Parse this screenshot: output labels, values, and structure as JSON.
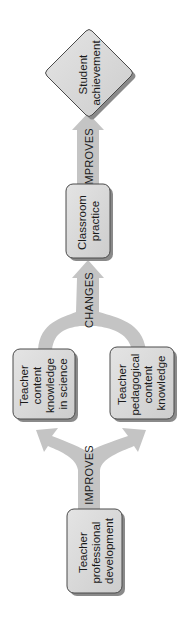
{
  "diagram": {
    "orientation": "rotated-90-ccw",
    "nodes": [
      {
        "id": "student_achievement",
        "shape": "diamond",
        "lines": [
          "Student",
          "achievement"
        ]
      },
      {
        "id": "classroom_practice",
        "shape": "rounded-rect",
        "lines": [
          "Classroom",
          "practice"
        ]
      },
      {
        "id": "content_knowledge",
        "shape": "rounded-rect",
        "lines": [
          "Teacher",
          "content",
          "knowledge",
          "in science"
        ]
      },
      {
        "id": "pedagogical_knowledge",
        "shape": "rounded-rect",
        "lines": [
          "Teacher",
          "pedagogical",
          "content",
          "knowledge"
        ]
      },
      {
        "id": "professional_development",
        "shape": "rounded-rect",
        "lines": [
          "Teacher",
          "professional",
          "development"
        ]
      }
    ],
    "edges": [
      {
        "from": "professional_development",
        "to": [
          "content_knowledge",
          "pedagogical_knowledge"
        ],
        "label": "IMPROVES"
      },
      {
        "from": [
          "content_knowledge",
          "pedagogical_knowledge"
        ],
        "to": "classroom_practice",
        "label": "CHANGES"
      },
      {
        "from": "classroom_practice",
        "to": "student_achievement",
        "label": "IMPROVES"
      }
    ]
  },
  "colors": {
    "box_fill": "#d6d6d6",
    "box_stroke": "#4a4a4a",
    "shadow": "#8a8a8a",
    "arrow_fill": "#c4c4c4",
    "text": "#1a1a1a"
  }
}
